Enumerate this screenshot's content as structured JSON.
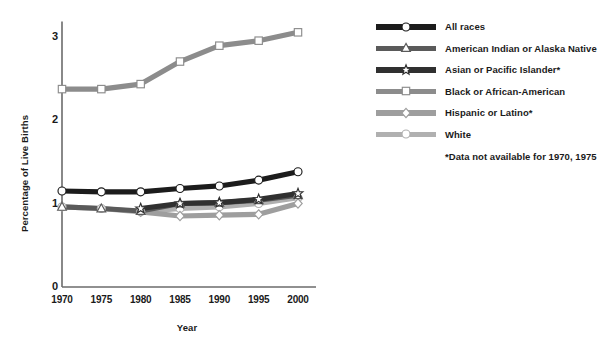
{
  "chart_data": {
    "type": "line",
    "title": "",
    "xlabel": "Year",
    "ylabel": "Percentage of Live Births",
    "x": [
      1970,
      1975,
      1980,
      1985,
      1990,
      1995,
      2000
    ],
    "xtick_labels": [
      "1970",
      "1975",
      "1980",
      "1985",
      "1990",
      "1995",
      "2000"
    ],
    "ytick_labels": [
      "0",
      "1",
      "2",
      "3"
    ],
    "ytick_values": [
      0,
      1,
      2,
      3
    ],
    "ylim": [
      0,
      3.18
    ],
    "xlim": [
      1968.2,
      2001.8
    ],
    "grid": false,
    "legend_position": "right",
    "series": [
      {
        "name": "All races",
        "color": "#1c1c1c",
        "marker": "circle",
        "values": [
          1.15,
          1.14,
          1.14,
          1.18,
          1.21,
          1.28,
          1.38
        ]
      },
      {
        "name": "American Indian or Alaska Native",
        "color": "#5a5a5a",
        "marker": "triangle",
        "values": [
          0.96,
          0.94,
          0.91,
          1.0,
          1.01,
          1.04,
          1.1
        ]
      },
      {
        "name": "Asian or Pacific Islander*",
        "color": "#303030",
        "marker": "star",
        "values": [
          null,
          null,
          0.94,
          1.0,
          1.01,
          1.05,
          1.12
        ]
      },
      {
        "name": "Black or African-American",
        "color": "#8c8c8c",
        "marker": "square",
        "values": [
          2.37,
          2.37,
          2.43,
          2.7,
          2.89,
          2.95,
          3.05
        ]
      },
      {
        "name": "Hispanic or Latino*",
        "color": "#9e9e9e",
        "marker": "diamond",
        "values": [
          null,
          null,
          0.9,
          0.85,
          0.86,
          0.87,
          1.0
        ]
      },
      {
        "name": "White",
        "color": "#b0b0b0",
        "marker": "circle",
        "values": [
          0.96,
          0.94,
          0.9,
          0.94,
          0.96,
          1.0,
          1.07
        ]
      }
    ],
    "footnote": "*Data not available for 1970, 1975"
  },
  "axes": {
    "y_title": "Percentage of Live Births",
    "x_title": "Year"
  },
  "legend": {
    "items": [
      {
        "label": "All races"
      },
      {
        "label": "American Indian or Alaska Native"
      },
      {
        "label": "Asian or Pacific Islander*"
      },
      {
        "label": "Black or African-American"
      },
      {
        "label": "Hispanic or Latino*"
      },
      {
        "label": "White"
      }
    ],
    "footnote": "*Data not available for 1970, 1975"
  },
  "colors": {
    "axis": "#6b6b6b",
    "text": "#1a1a1a",
    "background": "#ffffff"
  }
}
